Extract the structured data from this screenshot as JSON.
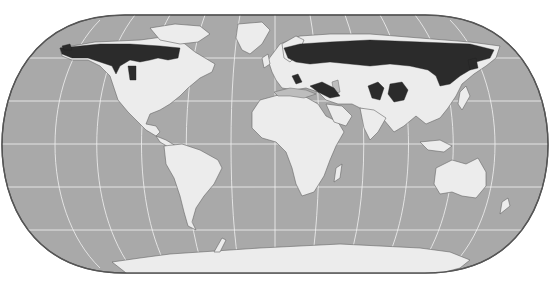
{
  "map": {
    "projection": "Eckert IV world (pseudo-cylindrical, rounded sides)",
    "colors": {
      "ocean": "#a9a9a9",
      "land": "#ececec",
      "highlighted_region": "#2b2b2b",
      "graticule": "#f2f2f2",
      "border": "#555555"
    },
    "legend": [],
    "title": "",
    "highlighted_regions": [
      "Alaska / northern Canada band",
      "Northern Europe / Siberia band",
      "Central Asian plateau patches",
      "Caucasus / Black Sea region"
    ]
  }
}
